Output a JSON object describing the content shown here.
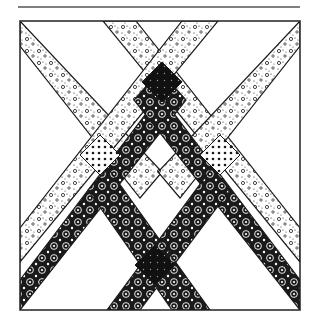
{
  "figure": {
    "title": "",
    "kind": "quilt-block-diagram",
    "width": 319,
    "height": 326,
    "header_rule": {
      "x1": 18,
      "x2": 300,
      "y": 7,
      "color": "#555555"
    },
    "frame": {
      "x": 20,
      "y": 21,
      "w": 280,
      "h": 289,
      "stroke": "#222222"
    },
    "colors": {
      "ink": "#1a1a1a",
      "paper": "#ffffff",
      "dark_cross": "#111111"
    },
    "strips": [
      {
        "name": "light-strip-topleft-to-bottomcenter",
        "fabric": "light-paisley",
        "points": [
          [
            20,
            21
          ],
          [
            20,
            46
          ],
          [
            140,
            198
          ],
          [
            162,
            172
          ]
        ]
      },
      {
        "name": "light-strip-topcenter-to-rightmid",
        "fabric": "light-paisley",
        "points": [
          [
            103,
            21
          ],
          [
            136,
            21
          ],
          [
            300,
            228
          ],
          [
            300,
            262
          ]
        ]
      },
      {
        "name": "light-strip-topright-to-bottomcenter",
        "fabric": "light-paisley",
        "points": [
          [
            300,
            21
          ],
          [
            300,
            46
          ],
          [
            180,
            198
          ],
          [
            158,
            172
          ]
        ]
      },
      {
        "name": "light-strip-topcenter-to-leftmid",
        "fabric": "light-paisley",
        "points": [
          [
            218,
            21
          ],
          [
            182,
            21
          ],
          [
            20,
            228
          ],
          [
            20,
            262
          ]
        ]
      },
      {
        "name": "dark-strip-bottomleft-to-topcenter",
        "fabric": "dark-flower",
        "points": [
          [
            20,
            310
          ],
          [
            20,
            280
          ],
          [
            170,
            82
          ],
          [
            186,
            100
          ]
        ]
      },
      {
        "name": "dark-strip-bottomright-to-topcenter",
        "fabric": "dark-flower",
        "points": [
          [
            300,
            310
          ],
          [
            300,
            280
          ],
          [
            150,
            82
          ],
          [
            134,
            100
          ]
        ]
      },
      {
        "name": "dark-strip-bottomcenter-to-left",
        "fabric": "dark-flower",
        "points": [
          [
            107,
            310
          ],
          [
            140,
            310
          ],
          [
            230,
            190
          ],
          [
            212,
            168
          ]
        ]
      },
      {
        "name": "dark-strip-bottomcenter-to-right",
        "fabric": "dark-flower",
        "points": [
          [
            210,
            310
          ],
          [
            172,
            310
          ],
          [
            88,
            190
          ],
          [
            108,
            168
          ]
        ]
      }
    ],
    "crossings": [
      {
        "name": "top-dark-crossing",
        "fabric": "solid-dark-dotted",
        "cx": 162,
        "cy": 82,
        "r": 20
      },
      {
        "name": "bottom-dark-crossing",
        "fabric": "solid-dark-dotted",
        "cx": 155,
        "cy": 265,
        "r": 20
      },
      {
        "name": "left-dot-crossing",
        "fabric": "polka-dot",
        "cx": 100,
        "cy": 155,
        "r": 20
      },
      {
        "name": "right-dot-crossing",
        "fabric": "polka-dot",
        "cx": 220,
        "cy": 155,
        "r": 20
      }
    ]
  }
}
